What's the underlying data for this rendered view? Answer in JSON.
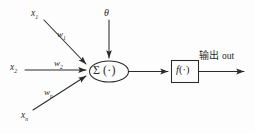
{
  "diagram": {
    "stroke_color": "#2b2b2b",
    "background_color": "#fdfdfd",
    "inputs": [
      {
        "id": "x1",
        "label": "x",
        "subscript": "1",
        "weight_label": "w",
        "weight_subscript": "1"
      },
      {
        "id": "x2",
        "label": "x",
        "subscript": "2",
        "weight_label": "w",
        "weight_subscript": "2"
      },
      {
        "id": "xn",
        "label": "x",
        "subscript": "n",
        "weight_label": "w",
        "weight_subscript": "n"
      }
    ],
    "bias": {
      "label": "θ"
    },
    "summation_node": {
      "symbol": "Σ",
      "argument": "(·)",
      "shape": "ellipse"
    },
    "activation_node": {
      "symbol": "f",
      "argument": "(·)",
      "shape": "rectangle"
    },
    "output": {
      "cjk_label": "输出",
      "latin_label": "out"
    }
  }
}
